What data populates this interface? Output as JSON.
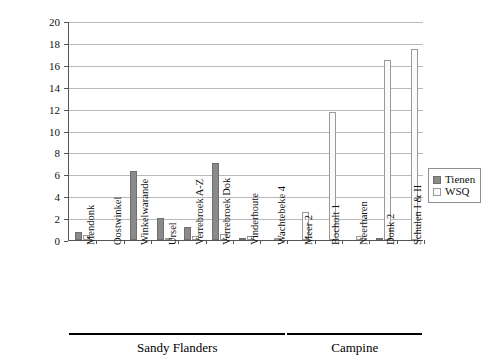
{
  "chart_data": {
    "type": "bar",
    "title": "",
    "xlabel": "",
    "ylabel": "",
    "ylim": [
      0,
      20
    ],
    "ytick_step": 2,
    "yticks": [
      0,
      2,
      4,
      6,
      8,
      10,
      12,
      14,
      16,
      18,
      20
    ],
    "grid": true,
    "legend_position": "right",
    "categories": [
      "Mendonk",
      "Oostwinkel",
      "Winkelwarande",
      "Ursel",
      "Verrebroek A-Z",
      "Verrebroek Dok",
      "Vinderhoute",
      "Wachtebeke 4",
      "Meer 2",
      "Bocholt 1",
      "Neerharen",
      "Donk 2",
      "Schulen I & II"
    ],
    "series": [
      {
        "name": "Tienen",
        "color": "#8a8a8a",
        "values": [
          0.7,
          0.0,
          6.3,
          2.0,
          1.2,
          7.0,
          0.15,
          0.0,
          0.0,
          0.0,
          0.0,
          0.1,
          0.0
        ]
      },
      {
        "name": "WSQ",
        "color": "#fbfbfb",
        "values": [
          0.45,
          0.0,
          0.0,
          0.1,
          0.4,
          0.55,
          0.35,
          0.05,
          2.6,
          11.7,
          0.35,
          16.4,
          17.4
        ]
      }
    ],
    "groups": [
      {
        "label": "Sandy Flanders",
        "start": 0,
        "end": 7
      },
      {
        "label": "Campine",
        "start": 8,
        "end": 12
      }
    ]
  },
  "legend": {
    "items": [
      {
        "label": "Tienen",
        "swatch": "solid-gray-swatch"
      },
      {
        "label": "WSQ",
        "swatch": "dotted-light-swatch"
      }
    ]
  }
}
